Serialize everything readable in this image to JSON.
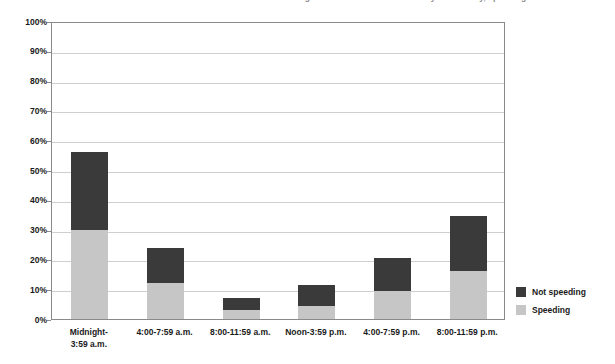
{
  "chart_data": {
    "type": "bar",
    "subtype": "stacked-bar",
    "title": "Percentage of drivers in fatal crashes by time of day, speeding",
    "xlabel": "",
    "ylabel": "",
    "ylim": [
      0,
      100
    ],
    "y_unit": "%",
    "grid": true,
    "legend_position": "right",
    "y_ticks": [
      "0%",
      "10%",
      "20%",
      "30%",
      "40%",
      "50%",
      "60%",
      "70%",
      "80%",
      "90%",
      "100%"
    ],
    "y_tick_values": [
      0,
      10,
      20,
      30,
      40,
      50,
      60,
      70,
      80,
      90,
      100
    ],
    "categories": [
      "Midnight-\n3:59 a.m.",
      "4:00-7:59 a.m.",
      "8:00-11:59 a.m.",
      "Noon-3:59 p.m.",
      "4:00-7:59 p.m.",
      "8:00-11:59 p.m."
    ],
    "series": [
      {
        "name": "Speeding",
        "color": "#c6c6c6",
        "values": [
          30.0,
          12.0,
          3.0,
          4.5,
          9.5,
          16.0
        ]
      },
      {
        "name": "Not speeding",
        "color": "#3a3a3a",
        "values": [
          26.0,
          12.0,
          4.0,
          7.0,
          11.0,
          18.5
        ]
      }
    ],
    "totals": [
      56.0,
      24.0,
      7.0,
      11.5,
      20.5,
      34.5
    ]
  },
  "legend": {
    "items": [
      {
        "label": "Not speeding",
        "color": "#3a3a3a"
      },
      {
        "label": "Speeding",
        "color": "#c6c6c6"
      }
    ]
  },
  "colors": {
    "not_speeding": "#3a3a3a",
    "speeding": "#c6c6c6",
    "gridline": "#cfcfcf",
    "axis": "#8a8a8a",
    "text": "#1a1a1a"
  }
}
